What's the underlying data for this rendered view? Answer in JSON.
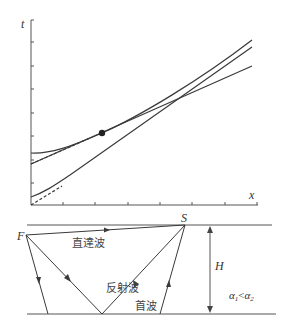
{
  "chart": {
    "y_axis_label": "t",
    "x_axis_label": "x",
    "curves": [
      {
        "name": "reflected-wave-hyperbola",
        "style": "solid"
      },
      {
        "name": "direct-wave-line",
        "style": "solid"
      },
      {
        "name": "head-wave-line",
        "style": "solid"
      },
      {
        "name": "tangent-asymptote-upper",
        "style": "dashed"
      },
      {
        "name": "tangent-asymptote-lower",
        "style": "dashed"
      }
    ],
    "critical_point": "filled-dot"
  },
  "model": {
    "source_label": "F",
    "receiver_label": "S",
    "direct_wave_label": "直達波",
    "reflected_wave_label": "反射波",
    "head_wave_label": "首波",
    "thickness_label": "H",
    "velocity_condition": {
      "left": "α",
      "left_sub": "1",
      "op": "<",
      "right": "α",
      "right_sub": "2"
    }
  },
  "colors": {
    "line": "#3a3a3a",
    "axis": "#555555",
    "background": "#ffffff"
  }
}
